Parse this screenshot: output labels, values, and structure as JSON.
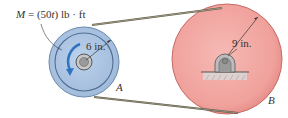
{
  "diagram": {
    "moment_label": {
      "symbol": "M",
      "expr": " = (50",
      "var": "t",
      "unit": ") lb · ft"
    },
    "pulley_a": {
      "label": "A",
      "radius_label": "6 in.",
      "color": "#a9c3e3",
      "rim_color": "#4d6f96"
    },
    "pulley_b": {
      "label": "B",
      "radius_label": "9 in.",
      "color": "#f1a7a3",
      "rim_color": "#c2605c"
    },
    "belt_color": "#6d6a5a",
    "arrow_color": "#2f74c0"
  }
}
